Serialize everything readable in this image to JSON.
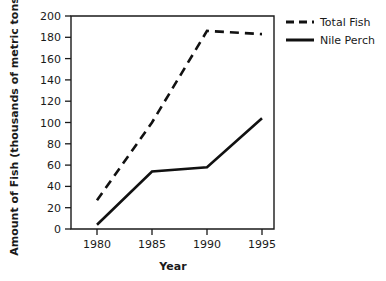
{
  "chart_data": {
    "type": "line",
    "title": "",
    "xlabel": "Year",
    "ylabel": "Amount of Fish (thousands of metric tons)",
    "x": [
      1980,
      1985,
      1990,
      1995
    ],
    "xticklabels": [
      "1980",
      "1985",
      "1990",
      "1995"
    ],
    "yticklabels": [
      "0",
      "20",
      "40",
      "60",
      "80",
      "100",
      "120",
      "140",
      "160",
      "180",
      "200"
    ],
    "yticks": [
      0,
      20,
      40,
      60,
      80,
      100,
      120,
      140,
      160,
      180,
      200
    ],
    "ylim": [
      0,
      200
    ],
    "xlim": [
      1978.5,
      1996.5
    ],
    "grid": false,
    "legend_position": "top-right",
    "series": [
      {
        "name": "Total Fish",
        "style": "dashed",
        "color": "#111111",
        "values": [
          27,
          100,
          186,
          183
        ]
      },
      {
        "name": "Nile Perch",
        "style": "solid",
        "color": "#111111",
        "values": [
          4,
          54,
          58,
          104
        ]
      }
    ]
  },
  "legend": {
    "items": [
      {
        "label": "Total Fish",
        "style": "dashed"
      },
      {
        "label": "Nile Perch",
        "style": "solid"
      }
    ]
  },
  "axes": {
    "x_title": "Year",
    "y_title": "Amount of Fish (thousands of metric tons)"
  }
}
